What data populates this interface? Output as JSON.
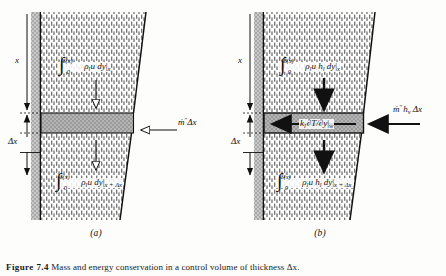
{
  "figure": {
    "caption_label": "Figure 7.4",
    "caption_text": "Mass and energy conservation in a control volume of thickness Δx.",
    "panels": [
      {
        "id": "a",
        "sub_caption": "(a)",
        "type": "mass-balance",
        "dimension_labels": [
          "x",
          "Δx"
        ],
        "arrow_style": "hollow",
        "flux_in_top": {
          "integral": "∫",
          "lower_limit": "0",
          "upper_limit": "δ(x)",
          "integrand": "ρ",
          "integrand_sub": "l",
          "integrand_rest": "u dy",
          "evaluated_at": "x"
        },
        "flux_out_bottom": {
          "integral": "∫",
          "lower_limit": "0",
          "upper_limit": "δ(x)",
          "integrand": "ρ",
          "integrand_sub": "l",
          "integrand_rest": "u dy",
          "evaluated_at": "x + Δx"
        },
        "side_flux": {
          "symbol": "ṁ",
          "superscript": "″",
          "factor": "Δx",
          "direction": "inward-left"
        }
      },
      {
        "id": "b",
        "sub_caption": "(b)",
        "type": "energy-balance",
        "dimension_labels": [
          "x",
          "Δx"
        ],
        "arrow_style": "solid",
        "flux_in_top": {
          "integral": "∫",
          "lower_limit": "0",
          "upper_limit": "δ(x)",
          "integrand": "ρ",
          "integrand_sub": "l",
          "integrand_rest": "u h",
          "integrand_sub2": "l",
          "integrand_tail": " dy",
          "evaluated_at": "x"
        },
        "flux_out_bottom": {
          "integral": "∫",
          "lower_limit": "0",
          "upper_limit": "δ(x)",
          "integrand": "ρ",
          "integrand_sub": "l",
          "integrand_rest": "u h",
          "integrand_sub2": "l",
          "integrand_tail": " dy",
          "evaluated_at": "x + Δx"
        },
        "wall_heat_flux": {
          "symbol": "k",
          "symbol_sub": "l",
          "expression": "∂T/∂y",
          "evaluated_at": "w",
          "direction": "outward-left"
        },
        "side_flux": {
          "symbol": "ṁ",
          "superscript": "″",
          "enthalpy": "h",
          "enthalpy_sub": "v",
          "factor": "Δx",
          "direction": "inward-left"
        }
      }
    ],
    "colors": {
      "wall_gray": "#b0b0b0",
      "cv_fill": "#a8a8a8",
      "hatch_ink": "#555555",
      "line": "#111111",
      "background": "#fdfdfb"
    }
  }
}
